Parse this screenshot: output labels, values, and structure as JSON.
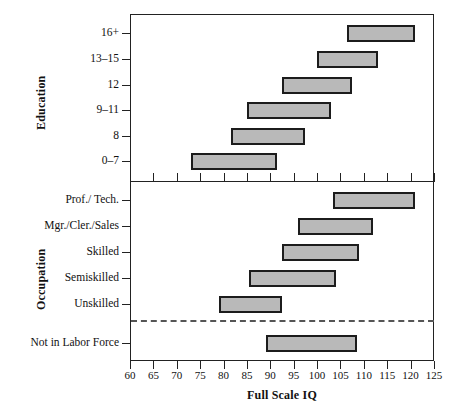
{
  "chart_data": {
    "type": "bar",
    "subtype": "horizontal-range-bars",
    "title": "",
    "xlabel": "Full Scale IQ",
    "ylabel": "",
    "xlim": [
      60,
      125
    ],
    "xticks": [
      60,
      65,
      70,
      75,
      80,
      85,
      90,
      95,
      100,
      105,
      110,
      115,
      120,
      125
    ],
    "grid": false,
    "legend": false,
    "panels": [
      {
        "name": "education",
        "axis_title": "Education",
        "categories": [
          "16+",
          "13–15",
          "12",
          "9–11",
          "8",
          "0–7"
        ],
        "ranges": [
          {
            "category": "16+",
            "low": 106.5,
            "high": 121.0
          },
          {
            "category": "13–15",
            "low": 100.0,
            "high": 113.0
          },
          {
            "category": "12",
            "low": 92.5,
            "high": 107.5
          },
          {
            "category": "9–11",
            "low": 85.0,
            "high": 103.0
          },
          {
            "category": "8",
            "low": 81.5,
            "high": 97.5
          },
          {
            "category": "0–7",
            "low": 73.0,
            "high": 91.5
          }
        ]
      },
      {
        "name": "occupation",
        "axis_title": "Occupation",
        "categories": [
          "Prof./ Tech.",
          "Mgr./Cler./Sales",
          "Skilled",
          "Semiskilled",
          "Unskilled",
          "Not in Labor Force"
        ],
        "ranges": [
          {
            "category": "Prof./ Tech.",
            "low": 103.5,
            "high": 121.0
          },
          {
            "category": "Mgr./Cler./Sales",
            "low": 96.0,
            "high": 112.0
          },
          {
            "category": "Skilled",
            "low": 92.5,
            "high": 109.0
          },
          {
            "category": "Semiskilled",
            "low": 85.5,
            "high": 104.0
          },
          {
            "category": "Unskilled",
            "low": 79.0,
            "high": 92.5
          },
          {
            "category": "Not in Labor Force",
            "low": 89.0,
            "high": 108.5
          }
        ],
        "separator_after": "Unskilled"
      }
    ],
    "colors": {
      "bar_fill": "#b9b9b9",
      "bar_stroke": "#1c1c1c",
      "axis": "#222222",
      "separator": "#555555"
    }
  },
  "axis": {
    "x_title": "Full Scale IQ",
    "y_title_education": "Education",
    "y_title_occupation": "Occupation",
    "tick_labels": [
      "60",
      "65",
      "70",
      "75",
      "80",
      "85",
      "90",
      "95",
      "100",
      "105",
      "110",
      "115",
      "120",
      "125"
    ]
  },
  "caption": ""
}
